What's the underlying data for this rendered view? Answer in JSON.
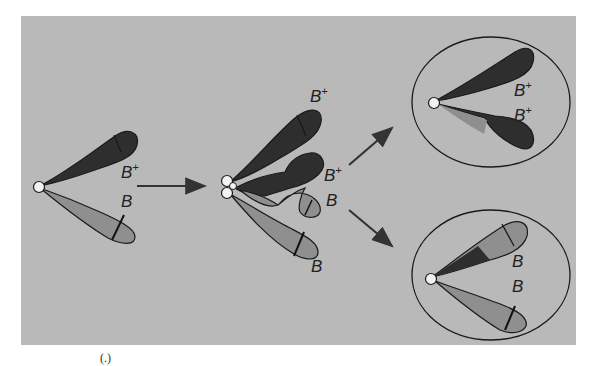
{
  "diagram": {
    "colors": {
      "background": "#b9b9b9",
      "dark_lobe": "#2e2e2e",
      "light_lobe": "#8f8f8f",
      "outline": "#1a1a1a",
      "nucleus": "#f2f2f2",
      "arrow": "#333333"
    },
    "stages": [
      {
        "id": "initial",
        "labels": [
          {
            "base": "B",
            "sup": "+"
          },
          {
            "base": "B",
            "sup": ""
          }
        ]
      },
      {
        "id": "overlap",
        "labels": [
          {
            "base": "B",
            "sup": "+"
          },
          {
            "base": "B",
            "sup": "+"
          },
          {
            "base": "B",
            "sup": ""
          },
          {
            "base": "B",
            "sup": ""
          }
        ]
      },
      {
        "id": "result-top",
        "labels": [
          {
            "base": "B",
            "sup": "+"
          },
          {
            "base": "B",
            "sup": "+"
          }
        ]
      },
      {
        "id": "result-bottom",
        "labels": [
          {
            "base": "B",
            "sup": ""
          },
          {
            "base": "B",
            "sup": ""
          }
        ]
      }
    ],
    "arrows": [
      "initial-to-overlap",
      "overlap-to-top",
      "overlap-to-bottom"
    ],
    "caption_fragment": "(.)"
  }
}
